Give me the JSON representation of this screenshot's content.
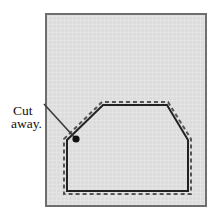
{
  "figure": {
    "canvas": {
      "width": 223,
      "height": 223,
      "background": "#ffffff"
    },
    "panel": {
      "name": "material-sheet",
      "x": 45,
      "y": 13,
      "width": 162,
      "height": 194,
      "fill": "#dcdcdc",
      "border_color": "#6e6e6e",
      "border_width": 2
    },
    "annotation": {
      "label_line1": "Cut",
      "label_line2": "away.",
      "label_color": "#111111",
      "leader_line": {
        "x1": 44,
        "y1": 104,
        "x2": 76,
        "y2": 139,
        "color": "#3a3a3a"
      },
      "arrow_dot": {
        "cx": 76,
        "cy": 139,
        "r": 3.6,
        "color": "#111111"
      }
    },
    "shape": {
      "name": "cut-outline-polygon",
      "description": "Hexagonal cut outline with chamfered top corners",
      "vertices": [
        {
          "x": 67,
          "y": 140
        },
        {
          "x": 103,
          "y": 105
        },
        {
          "x": 167,
          "y": 105
        },
        {
          "x": 188,
          "y": 140
        },
        {
          "x": 188,
          "y": 191
        },
        {
          "x": 67,
          "y": 191
        }
      ],
      "solid_stroke_color": "#222222",
      "solid_stroke_width": 2,
      "dashed_stroke_color": "#555555",
      "dashed_stroke_width": 2,
      "dash_pattern": "4 3",
      "dash_offset_px": 3.5
    }
  }
}
